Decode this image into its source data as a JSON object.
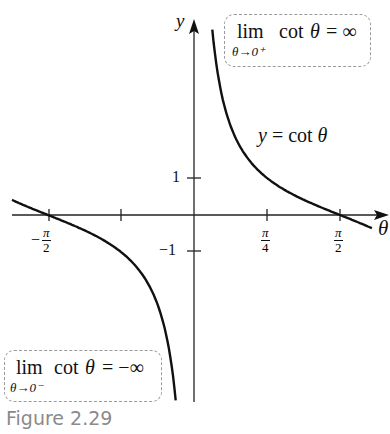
{
  "chart_data": {
    "type": "line",
    "title": "",
    "function": "y = cot θ",
    "xlabel": "θ",
    "ylabel": "y",
    "x_ticks": [
      {
        "value": -1.5708,
        "label": "−π/2",
        "num": "π",
        "den": "2",
        "sign": "−"
      },
      {
        "value": -0.7854,
        "label": ""
      },
      {
        "value": 0.7854,
        "label": "π/4",
        "num": "π",
        "den": "4",
        "sign": ""
      },
      {
        "value": 1.5708,
        "label": "π/2",
        "num": "π",
        "den": "2",
        "sign": ""
      }
    ],
    "y_ticks": [
      {
        "value": 1,
        "label": "1"
      },
      {
        "value": -1,
        "label": "−1"
      }
    ],
    "xlim": [
      -1.96,
      1.92
    ],
    "ylim": [
      -5.0,
      5.0
    ],
    "series": [
      {
        "name": "left branch",
        "domain": [
          -1.958,
          -0.197
        ],
        "x": [
          -1.958,
          -1.5708,
          -1.2,
          -0.7854,
          -0.5,
          -0.3,
          -0.197
        ],
        "y": [
          0.41,
          0.0,
          -0.39,
          -1.0,
          -1.83,
          -3.23,
          -5.0
        ]
      },
      {
        "name": "right branch",
        "domain": [
          0.197,
          1.914
        ],
        "x": [
          0.197,
          0.3,
          0.5,
          0.7854,
          1.2,
          1.5708,
          1.914
        ],
        "y": [
          5.0,
          3.23,
          1.83,
          1.0,
          0.39,
          0.0,
          -0.35
        ]
      }
    ],
    "annotations": [
      {
        "text": "y = cot θ",
        "near": "right branch"
      },
      {
        "text": "lim θ→0⁺ cot θ = ∞",
        "position": "top-right"
      },
      {
        "text": "lim θ→0⁻ cot θ = −∞",
        "position": "bottom-left"
      }
    ],
    "grid": false,
    "legend": "none"
  },
  "labels": {
    "y_axis": "y",
    "x_axis": "θ",
    "curve_label_lhs": "y",
    "curve_label_rhs": "= cot",
    "curve_label_var": "θ",
    "lim_right": {
      "lim": "lim",
      "sub": "θ→0⁺",
      "cot": "cot",
      "var": "θ",
      "rhs": "= ∞"
    },
    "lim_left": {
      "lim": "lim",
      "sub": "θ→0⁻",
      "cot": "cot",
      "var": "θ",
      "rhs": "= −∞"
    },
    "tick_y1": "1",
    "tick_ym1": "−1",
    "tick_neg_pi2_sign": "−",
    "tick_pi": "π",
    "tick_den2": "2",
    "tick_den4": "4",
    "caption": "Figure 2.29"
  },
  "colors": {
    "curve": "#111111",
    "axis": "#222222",
    "box_border": "#9a9a9a",
    "caption": "#8a8a8a"
  }
}
